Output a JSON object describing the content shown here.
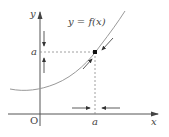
{
  "diagram": {
    "type": "function-graph-fixed-point",
    "curve_label": "y = f(x)",
    "axes": {
      "x_label": "x",
      "y_label": "y",
      "origin_label": "O"
    },
    "point": {
      "x_label": "a",
      "y_label": "a"
    },
    "colors": {
      "axis": "#555555",
      "curve": "#999999",
      "dash": "#888888",
      "point": "#111111",
      "arrow": "#333333"
    }
  }
}
